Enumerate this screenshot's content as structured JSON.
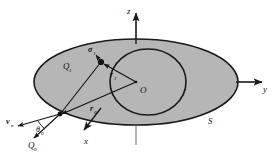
{
  "figure": {
    "type": "geometry-diagram",
    "colors": {
      "surface_fill": "#b6b6b6",
      "outline": "#1a1a1a",
      "axis": "#555555",
      "text": "#111111"
    },
    "axes": [
      {
        "id": "z",
        "label": "z",
        "direction": "up"
      },
      {
        "id": "y",
        "label": "y",
        "direction": "right"
      },
      {
        "id": "x",
        "label": "x",
        "direction": "down-left"
      }
    ],
    "origin_label": "O",
    "surface_label": "S",
    "points": [
      {
        "id": "Q1",
        "label": "Q",
        "subscript": "1"
      },
      {
        "id": "Q0",
        "label": "Q",
        "subscript": "0"
      }
    ],
    "vectors": [
      {
        "id": "sigma1",
        "label": "σ",
        "subscript": "1"
      },
      {
        "id": "r1",
        "label": "r",
        "subscript": "1"
      },
      {
        "id": "r0",
        "label": "r",
        "subscript": "0"
      },
      {
        "id": "v",
        "label": "v",
        "subscript": "n"
      }
    ],
    "angles": [
      {
        "id": "theta0",
        "label": "θ",
        "subscript": "0"
      }
    ]
  }
}
